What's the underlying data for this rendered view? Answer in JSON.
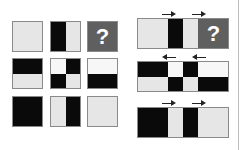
{
  "colors": {
    "light": "#e6e6e6",
    "dark": "#0a0a0a",
    "white": "#f7f7f7",
    "question_bg": "#5f5f5f",
    "question_fg": "#ffffff",
    "border": "#8a8a8a"
  },
  "left_grid": {
    "rows": [
      [
        {
          "pattern": "solid-light"
        },
        {
          "pattern": "vertical-half",
          "left": "dark",
          "right": "light"
        },
        {
          "pattern": "question",
          "label": "?"
        }
      ],
      [
        {
          "pattern": "horizontal-half",
          "top": "dark",
          "bottom": "light"
        },
        {
          "pattern": "checker",
          "tl": "white",
          "tr": "dark",
          "bl": "dark",
          "br": "light"
        },
        {
          "pattern": "horizontal-half",
          "top": "white",
          "bottom": "dark"
        }
      ],
      [
        {
          "pattern": "solid-dark"
        },
        {
          "pattern": "vertical-half",
          "left": "light",
          "right": "dark"
        },
        {
          "pattern": "solid-light"
        }
      ]
    ]
  },
  "right_panel": {
    "strips": [
      {
        "arrows": [
          "right",
          "right"
        ],
        "segments": [
          "light",
          "dark",
          "light",
          "question"
        ],
        "question_label": "?"
      },
      {
        "arrows": [
          "left",
          "left"
        ],
        "top_segments": [
          "dark",
          "white",
          "dark",
          "white"
        ],
        "bottom_segments": [
          "light",
          "dark",
          "light",
          "dark"
        ]
      },
      {
        "arrows": [
          "right",
          "right"
        ],
        "segments": [
          "dark",
          "light",
          "dark",
          "light"
        ]
      }
    ]
  }
}
